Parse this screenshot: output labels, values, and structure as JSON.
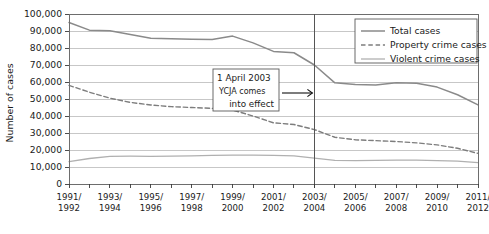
{
  "chart_data": {
    "type": "line",
    "title": "",
    "xlabel": "",
    "ylabel": "Number of cases",
    "ylim": [
      0,
      100000
    ],
    "ytick_step": 10000,
    "grid": true,
    "legend_position": "top-right",
    "x": [
      "1991/1992",
      "1992/1993",
      "1993/1994",
      "1994/1995",
      "1995/1996",
      "1996/1997",
      "1997/1998",
      "1998/1999",
      "1999/2000",
      "2000/2001",
      "2001/2002",
      "2002/2003",
      "2003/2004",
      "2004/2005",
      "2005/2006",
      "2006/2007",
      "2007/2008",
      "2008/2009",
      "2009/2010",
      "2010/2011",
      "2011/2012"
    ],
    "x_tick_labels": [
      {
        "index": 0,
        "line1": "1991/",
        "line2": "1992"
      },
      {
        "index": 2,
        "line1": "1993/",
        "line2": "1994"
      },
      {
        "index": 4,
        "line1": "1995/",
        "line2": "1996"
      },
      {
        "index": 6,
        "line1": "1997/",
        "line2": "1998"
      },
      {
        "index": 8,
        "line1": "1999/",
        "line2": "2000"
      },
      {
        "index": 10,
        "line1": "2001/",
        "line2": "2002"
      },
      {
        "index": 12,
        "line1": "2003/",
        "line2": "2004"
      },
      {
        "index": 14,
        "line1": "2005/",
        "line2": "2006"
      },
      {
        "index": 16,
        "line1": "2007/",
        "line2": "2008"
      },
      {
        "index": 18,
        "line1": "2009/",
        "line2": "2010"
      },
      {
        "index": 20,
        "line1": "2011/",
        "line2": "2012"
      }
    ],
    "y_tick_labels": [
      "0",
      "10,000",
      "20,000",
      "30,000",
      "40,000",
      "50,000",
      "60,000",
      "70,000",
      "80,000",
      "90,000",
      "100,000"
    ],
    "series": [
      {
        "name": "Total cases",
        "style": "solid",
        "color": "#8a8a8a",
        "width": 1.5,
        "values": [
          95000,
          90500,
          90200,
          88000,
          85800,
          85500,
          85200,
          85000,
          87000,
          83000,
          78000,
          77200,
          70000,
          59500,
          58500,
          58300,
          59500,
          59200,
          57000,
          52500,
          46500
        ]
      },
      {
        "name": "Property crime cases",
        "style": "dashed",
        "color": "#7d7d7d",
        "width": 1.4,
        "values": [
          58000,
          54000,
          50500,
          48000,
          46500,
          45500,
          45000,
          44500,
          43500,
          40000,
          36000,
          35000,
          32000,
          27500,
          26000,
          25500,
          25000,
          24200,
          23000,
          21000,
          18000
        ]
      },
      {
        "name": "Violent crime cases",
        "style": "solid",
        "color": "#b0b0b0",
        "width": 1.3,
        "values": [
          13200,
          15000,
          16300,
          16400,
          16300,
          16400,
          16500,
          16800,
          17000,
          17000,
          16800,
          16600,
          15200,
          13900,
          13800,
          13900,
          14100,
          14000,
          13800,
          13400,
          12600
        ]
      }
    ],
    "annotations": [
      {
        "id": "ycja-annotation",
        "line1": "1 April 2003",
        "line2": "YCJA comes",
        "line3": "into effect",
        "arrow": "right-arrow",
        "target_x_index": 12
      }
    ],
    "event_marker": {
      "label": "2003/2004",
      "x_index": 12
    }
  }
}
